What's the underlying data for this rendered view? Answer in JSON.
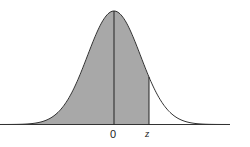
{
  "diagram": {
    "title": "",
    "type": "normal-distribution-shaded-area",
    "labels": {
      "mean": "0",
      "z": "z"
    },
    "colors": {
      "shade": "#a8a8a8",
      "stroke": "#333333",
      "background": "#ffffff"
    },
    "shaded_region": "from -infinity to z"
  }
}
